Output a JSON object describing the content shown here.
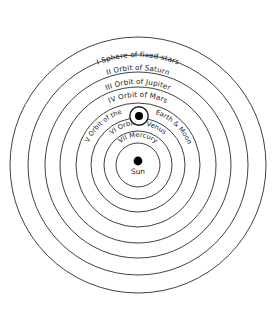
{
  "figure": {
    "center": {
      "x": 138,
      "y": 165
    },
    "background_color": "#ffffff",
    "stroke_color": "#2b2b2b",
    "text_color": "#1c1c1c"
  },
  "spheres": [
    {
      "numeral": "I",
      "label": "I Sphere of fixed stars",
      "radius": 128,
      "name": "sphere-of-fixed-stars"
    },
    {
      "numeral": "II",
      "label": "II Orbit of Saturn",
      "radius": 110,
      "name": "orbit-of-saturn"
    },
    {
      "numeral": "III",
      "label": "III Orbit of Jupiter",
      "radius": 93,
      "name": "orbit-of-jupiter"
    },
    {
      "numeral": "IV",
      "label": "IV Orbit of Mars",
      "radius": 78,
      "name": "orbit-of-mars"
    },
    {
      "numeral": "V",
      "label": "V Orbit of the Earth & Moon",
      "radius": 62,
      "name": "orbit-of-earth-and-moon"
    },
    {
      "numeral": "VI",
      "label": "VI Orbit of Venus",
      "radius": 47,
      "name": "orbit-of-venus"
    },
    {
      "numeral": "VII",
      "label": "VII Mercury",
      "radius": 34,
      "name": "orbit-of-mercury"
    },
    {
      "numeral": "",
      "label": "",
      "radius": 22,
      "name": "solar-circle"
    }
  ],
  "bodies": {
    "sun": {
      "label": "Sun",
      "dot_radius": 4.4,
      "x": 138,
      "y": 161,
      "label_x": 138,
      "label_y": 173
    },
    "earth_moon": {
      "label": "Earth & Moon",
      "circle_radius": 9.2,
      "dot_radius": 4.0,
      "x": 139,
      "y": 116
    }
  },
  "labels": {
    "sphere_i": "I Sphere of fixed stars",
    "orbit_ii": "II Orbit of Saturn",
    "orbit_iii": "III Orbit of Jupiter",
    "orbit_iv": "IV Orbit of Mars",
    "orbit_v_left": "V Orbit of the",
    "orbit_v_right": "Earth & Moon",
    "orbit_vi": "VI Orbit of Venus",
    "orbit_vii": "VII Mercury",
    "sun": "Sun"
  }
}
